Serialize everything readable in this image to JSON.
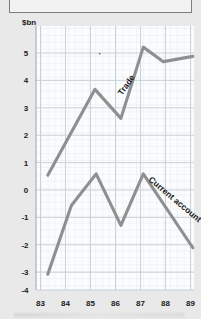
{
  "page": {
    "background_color": "#e9e9e9",
    "top_box": {
      "label": "",
      "border_color": "#7d7d7d"
    }
  },
  "chart_data": {
    "type": "line",
    "title": "",
    "subtitle": "",
    "xlabel": "",
    "ylabel": "$bn",
    "unit_label": "$bn",
    "x": [
      83,
      84,
      85,
      86,
      87,
      88,
      89
    ],
    "categories": [
      "83",
      "84",
      "85",
      "86",
      "87",
      "88",
      "89"
    ],
    "xtick_labels": [
      "83",
      "84",
      "85",
      "86",
      "87",
      "88",
      "89"
    ],
    "ytick_labels": [
      "5",
      "4",
      "3",
      "2",
      "1",
      "0",
      "-1",
      "-2",
      "-3",
      "-4"
    ],
    "ytick_values": [
      5,
      4,
      3,
      2,
      1,
      0,
      -1,
      -2,
      -3,
      -4
    ],
    "ylim": [
      -4.4,
      5.6
    ],
    "xlim": [
      82.7,
      89.4
    ],
    "grid": true,
    "grid_minor": true,
    "grid_color": "#c9d2da",
    "grid_minor_color": "#e2e7ec",
    "legend": "inline-labels",
    "series": [
      {
        "name": "Trade",
        "label": "Trade",
        "color": "#8f8f8f",
        "x": [
          83.2,
          85.2,
          86.3,
          87.25,
          88.1,
          89.35
        ],
        "values": [
          -0.05,
          3.2,
          2.1,
          4.8,
          4.25,
          4.45
        ],
        "label_rotation": -55
      },
      {
        "name": "Current account",
        "label": "Current account",
        "color": "#8f8f8f",
        "x": [
          83.2,
          84.2,
          85.25,
          86.3,
          87.25,
          89.35
        ],
        "values": [
          -3.8,
          -1.2,
          0.0,
          -1.95,
          0.0,
          -2.8
        ],
        "label_rotation": 40
      }
    ],
    "annotations": [
      {
        "name": "stray-dot",
        "x": 85.4,
        "y": 4.55
      }
    ]
  }
}
